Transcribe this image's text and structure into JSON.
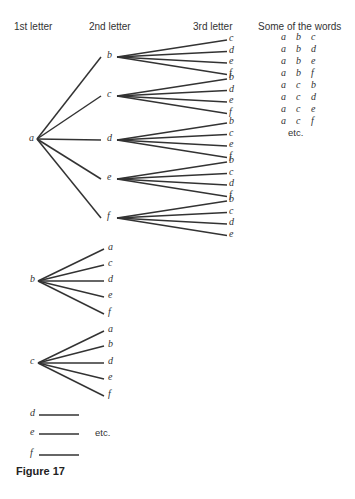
{
  "headers": {
    "first": "1st letter",
    "second": "2nd letter",
    "third": "3rd letter",
    "words": "Some of the words"
  },
  "tree_a": {
    "root": "a",
    "branches": [
      {
        "letter": "b",
        "children": [
          "c",
          "d",
          "e",
          "f"
        ]
      },
      {
        "letter": "c",
        "children": [
          "b",
          "d",
          "e",
          "f"
        ]
      },
      {
        "letter": "d",
        "children": [
          "b",
          "c",
          "e",
          "f"
        ]
      },
      {
        "letter": "e",
        "children": [
          "b",
          "c",
          "d",
          "f"
        ]
      },
      {
        "letter": "f",
        "children": [
          "b",
          "c",
          "d",
          "e"
        ]
      }
    ]
  },
  "tree_b": {
    "root": "b",
    "children": [
      "a",
      "c",
      "d",
      "e",
      "f"
    ]
  },
  "tree_c": {
    "root": "c",
    "children": [
      "a",
      "b",
      "d",
      "e",
      "f"
    ]
  },
  "stubs": [
    "d",
    "e",
    "f"
  ],
  "stubs_etc": "etc.",
  "words": [
    [
      "a",
      "b",
      "c"
    ],
    [
      "a",
      "b",
      "d"
    ],
    [
      "a",
      "b",
      "e"
    ],
    [
      "a",
      "b",
      "f"
    ],
    [
      "a",
      "c",
      "b"
    ],
    [
      "a",
      "c",
      "d"
    ],
    [
      "a",
      "c",
      "e"
    ],
    [
      "a",
      "c",
      "f"
    ]
  ],
  "words_etc": "etc.",
  "caption": "Figure 17"
}
